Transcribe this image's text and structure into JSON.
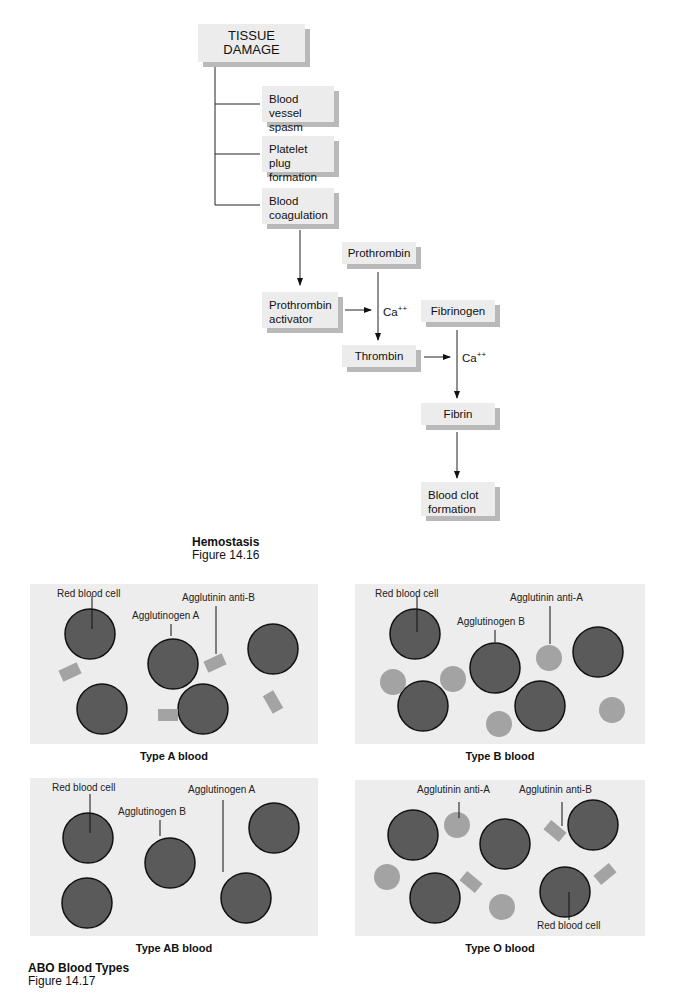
{
  "hemostasis": {
    "boxes": {
      "tissue_damage": "TISSUE DAMAGE",
      "vessel_spasm": "Blood vessel spasm",
      "platelet_plug": "Platelet plug formation",
      "coagulation": "Blood coagulation",
      "prothrombin": "Prothrombin",
      "prothrombin_activator": "Prothrombin activator",
      "thrombin": "Thrombin",
      "fibrinogen": "Fibrinogen",
      "fibrin": "Fibrin",
      "blood_clot": "Blood clot formation"
    },
    "cofactor": "Ca",
    "cofactor_charge": "++",
    "caption_title": "Hemostasis",
    "caption_figure": "Figure 14.16"
  },
  "abo": {
    "panels": {
      "a": {
        "title": "Type A blood",
        "labels": [
          "Red blood cell",
          "Agglutinogen A",
          "Agglutinin anti-B"
        ]
      },
      "b": {
        "title": "Type B blood",
        "labels": [
          "Red blood cell",
          "Agglutinogen B",
          "Agglutinin anti-A"
        ]
      },
      "ab": {
        "title": "Type AB blood",
        "labels": [
          "Red blood cell",
          "Agglutinogen B",
          "Agglutinogen A"
        ]
      },
      "o": {
        "title": "Type O blood",
        "labels": [
          "Agglutinin anti-A",
          "Agglutinin anti-B",
          "Red blood cell"
        ]
      }
    },
    "caption_title": "ABO Blood Types",
    "caption_figure": "Figure 14.17"
  },
  "colors": {
    "panel": "#ededed",
    "cell": "#5a5a5a",
    "agglutinin": "#a3a3a3",
    "box": "#ececec",
    "box_shadow": "#b9b9b9"
  }
}
